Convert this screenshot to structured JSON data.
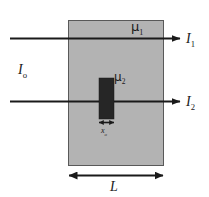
{
  "figure": {
    "type": "physics-schematic",
    "colors": {
      "slab_fill": "#b3b3b3",
      "slab_stroke": "#4d4d4d",
      "insert_fill": "#262626",
      "line": "#1a1a1a",
      "background": "#ffffff",
      "text": "#1a1a1a"
    },
    "slab": {
      "name": "attenuating-slab",
      "x": 68,
      "y": 20,
      "width": 95,
      "height": 145,
      "attenuation_label": "μ",
      "attenuation_subscript": "1"
    },
    "insert": {
      "name": "embedded-absorber",
      "x": 99,
      "y": 78,
      "width": 15,
      "height": 41,
      "attenuation_label": "μ",
      "attenuation_subscript": "2"
    },
    "beams": [
      {
        "name": "upper-beam",
        "y": 38,
        "x_start": 10,
        "x_end": 180,
        "output_label": "I",
        "output_subscript": "1"
      },
      {
        "name": "lower-beam",
        "y": 101,
        "x_start": 10,
        "x_end": 180,
        "output_label": "I",
        "output_subscript": "2"
      }
    ],
    "labels": {
      "incident_intensity": "I",
      "incident_intensity_subscript": "o",
      "mu1": "μ",
      "mu1_subscript": "1",
      "mu2": "μ",
      "mu2_subscript": "2",
      "I1": "I",
      "I1_subscript": "1",
      "I2": "I",
      "I2_subscript": "2",
      "insert_thickness": "x",
      "insert_thickness_subscript": "o",
      "slab_thickness": "L"
    },
    "dimensions": [
      {
        "name": "insert-thickness-dimension",
        "label": "x",
        "subscript": "o",
        "y": 122,
        "x_start": 99,
        "x_end": 114
      },
      {
        "name": "slab-thickness-dimension",
        "label": "L",
        "subscript": "",
        "y": 175,
        "x_start": 68,
        "x_end": 163
      }
    ]
  }
}
